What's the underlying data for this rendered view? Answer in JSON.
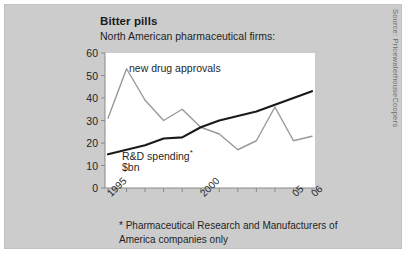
{
  "figure": {
    "title": "Bitter pills",
    "subtitle": "North American pharmaceutical firms:",
    "source": "Source: PricewaterhouseCoopers",
    "footnote": "* Pharmaceutical Research and Manufacturers of America companies only",
    "background_color": "#cccccc",
    "plot_background_color": "#ffffff"
  },
  "labels": {
    "approvals": "new drug approvals",
    "rd_line1": "R&D spending",
    "rd_star": "*",
    "rd_line2": "$bn"
  },
  "chart_data": {
    "type": "line",
    "title": "Bitter pills",
    "subtitle": "North American pharmaceutical firms:",
    "xlabel": "",
    "ylabel": "",
    "ylim": [
      0,
      60
    ],
    "yticks": [
      0,
      10,
      20,
      30,
      40,
      50,
      60
    ],
    "ytick_labels": [
      "0",
      "10",
      "20",
      "30",
      "40",
      "50",
      "60"
    ],
    "x": [
      1995,
      1996,
      1997,
      1998,
      1999,
      2000,
      2001,
      2002,
      2003,
      2004,
      2005,
      2006
    ],
    "xtick_labels": [
      "1995",
      "",
      "",
      "",
      "",
      "2000",
      "",
      "",
      "",
      "",
      "05",
      "06"
    ],
    "xticks_shown": [
      0,
      5,
      10,
      11
    ],
    "grid": false,
    "legend": "in-plot annotations",
    "series": [
      {
        "name": "new drug approvals",
        "color": "#999999",
        "width": 1.4,
        "values": [
          31,
          53,
          39,
          30,
          35,
          27,
          24,
          17,
          21,
          36,
          21,
          23
        ]
      },
      {
        "name": "R&D spending ($bn)",
        "color": "#1a1a1a",
        "width": 2.2,
        "values": [
          15,
          17,
          19,
          22,
          22.5,
          27,
          30,
          32,
          34,
          37,
          40,
          43
        ]
      }
    ],
    "annotations": [
      {
        "text": "new drug approvals",
        "x": 1996.3,
        "y": 51
      },
      {
        "text": "R&D spending*",
        "x": 1995.8,
        "y": 12
      },
      {
        "text": "$bn",
        "x": 1995.8,
        "y": 7
      }
    ]
  }
}
